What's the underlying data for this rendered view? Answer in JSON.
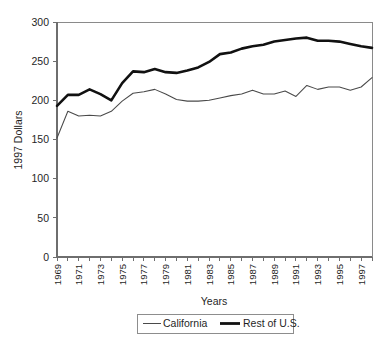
{
  "chart_data": {
    "type": "line",
    "title": "",
    "xlabel": "Years",
    "ylabel": "1997 Dollars",
    "ylim": [
      0,
      300
    ],
    "yticks": [
      0,
      50,
      100,
      150,
      200,
      250,
      300
    ],
    "xlim": [
      1969,
      1998
    ],
    "xticks": [
      1969,
      1971,
      1973,
      1975,
      1977,
      1979,
      1981,
      1983,
      1985,
      1987,
      1989,
      1991,
      1993,
      1995,
      1997
    ],
    "xtick_labels": [
      "1969",
      "1971",
      "1973",
      "1975",
      "1977",
      "1979",
      "1981",
      "1983",
      "1985",
      "1987",
      "1989",
      "1991",
      "1993",
      "1995",
      "1997"
    ],
    "x": [
      1969,
      1970,
      1971,
      1972,
      1973,
      1974,
      1975,
      1976,
      1977,
      1978,
      1979,
      1980,
      1981,
      1982,
      1983,
      1984,
      1985,
      1986,
      1987,
      1988,
      1989,
      1990,
      1991,
      1992,
      1993,
      1994,
      1995,
      1996,
      1997,
      1998
    ],
    "grid": false,
    "legend_position": "bottom",
    "series": [
      {
        "name": "California",
        "style": "thin",
        "color": "#4a4a4a",
        "values": [
          152,
          186,
          180,
          181,
          180,
          186,
          199,
          209,
          211,
          214,
          208,
          201,
          199,
          199,
          200,
          203,
          206,
          208,
          213,
          208,
          208,
          212,
          205,
          219,
          214,
          217,
          217,
          213,
          217,
          229
        ]
      },
      {
        "name": "Rest of U.S.",
        "style": "thick",
        "color": "#111111",
        "values": [
          193,
          207,
          207,
          214,
          208,
          200,
          222,
          237,
          236,
          240,
          236,
          235,
          238,
          242,
          249,
          259,
          261,
          266,
          269,
          271,
          275,
          277,
          279,
          280,
          276,
          276,
          275,
          272,
          269,
          267
        ]
      }
    ]
  },
  "axis": {
    "y_title": "1997 Dollars",
    "x_title": "Years"
  },
  "legend": {
    "items": [
      {
        "label": "California",
        "style": "thin"
      },
      {
        "label": "Rest of U.S.",
        "style": "thick"
      }
    ]
  }
}
